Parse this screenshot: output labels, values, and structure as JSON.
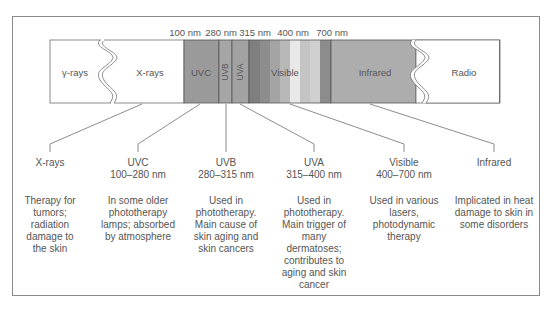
{
  "diagram": {
    "ticks": [
      {
        "label": "100 nm",
        "x": 193
      },
      {
        "label": "280 nm",
        "x": 228
      },
      {
        "label": "315 nm",
        "x": 262
      },
      {
        "label": "400 nm",
        "x": 300
      },
      {
        "label": "700 nm",
        "x": 336
      }
    ],
    "bands": [
      {
        "label": "γ-rays",
        "color": "#ffffff"
      },
      {
        "label": "X-rays",
        "color": "#ffffff"
      },
      {
        "label": "UVC",
        "color": "#9a9a9a"
      },
      {
        "label": "UVB",
        "color": "#a6a6a6"
      },
      {
        "label": "UVA",
        "color": "#a2a2a2"
      },
      {
        "label": "Visible",
        "color": "#b4b4b4"
      },
      {
        "label": "Infrared",
        "color": "#adadad"
      },
      {
        "label": "Radio",
        "color": "#ffffff"
      }
    ],
    "visible_stripes": [
      "#7f7f7f",
      "#8d8d8d",
      "#a4a4a4",
      "#b8b8b8",
      "#e8e8e8",
      "#c4c4c4",
      "#8c8c8c"
    ],
    "columns": [
      {
        "name": "X-rays",
        "range": "",
        "desc": "Therapy for tumors; radiation damage to the skin"
      },
      {
        "name": "UVC",
        "range": "100–280 nm",
        "desc": "In some older phototherapy lamps; absorbed by atmosphere"
      },
      {
        "name": "UVB",
        "range": "280–315 nm",
        "desc": "Used in phototherapy. Main cause of skin aging and skin cancers"
      },
      {
        "name": "UVA",
        "range": "315–400 nm",
        "desc": "Used in phototherapy. Main trigger of many dermatoses; contributes to aging and skin cancer"
      },
      {
        "name": "Visible",
        "range": "400–700 nm",
        "desc": "Used in various lasers, photodynamic therapy"
      },
      {
        "name": "Infrared",
        "range": "",
        "desc": "Implicated in heat damage to skin in some disorders"
      }
    ],
    "colors": {
      "frame": "#8a8a8a",
      "line": "#6f6f6f",
      "text": "#555555"
    }
  }
}
